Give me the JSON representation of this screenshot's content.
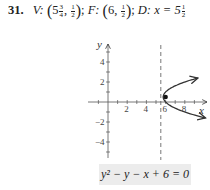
{
  "problem": {
    "number": "31.",
    "vertex_label": "V:",
    "vertex_whole": "5",
    "vertex_x_num": "3",
    "vertex_x_den": "4",
    "vertex_y_num": "1",
    "vertex_y_den": "2",
    "focus_label": "F:",
    "focus_x": "6",
    "focus_y_num": "1",
    "focus_y_den": "2",
    "directrix_label": "D:",
    "directrix_eq_prefix": "x = 5",
    "directrix_num": "1",
    "directrix_den": "2"
  },
  "equation": "y² − y − x + 6 = 0",
  "chart_data": {
    "type": "line",
    "title": "",
    "xlabel": "x",
    "ylabel": "y",
    "x_ticks": [
      2,
      4,
      6,
      8
    ],
    "y_ticks": [
      -4,
      -2,
      2,
      4
    ],
    "xlim": [
      -2,
      10
    ],
    "ylim": [
      -6,
      6
    ],
    "grid": false,
    "series": [
      {
        "name": "parabola x = y^2 - y + 6",
        "y_range": [
          -1.6,
          2.4
        ],
        "style": "solid",
        "arrows": true
      }
    ],
    "vertex": [
      5.75,
      0.5
    ],
    "focus": [
      6,
      0.5
    ],
    "directrix_x": 5.5,
    "annotation": "y² − y − x + 6 = 0"
  }
}
